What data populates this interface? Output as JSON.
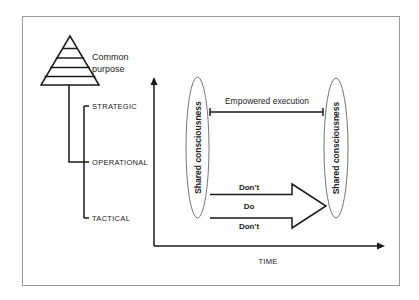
{
  "diagram": {
    "pyramid_label_line1": "Common",
    "pyramid_label_line2": "purpose",
    "levels": [
      {
        "label": "STRATEGIC"
      },
      {
        "label": "OPERATIONAL"
      },
      {
        "label": "TACTICAL"
      }
    ],
    "left_ellipse_label": "Shared consciousness",
    "right_ellipse_label": "Shared consciousness",
    "span_label": "Empowered execution",
    "arrow_labels": {
      "top": "Don't",
      "middle": "Do",
      "bottom": "Don't"
    },
    "x_axis_label": "TIME"
  },
  "colors": {
    "stroke": "#1a1a1a",
    "frame": "#9a9a9a",
    "ellipse": "#777777",
    "text": "#222222"
  }
}
